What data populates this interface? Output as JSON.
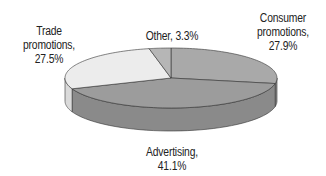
{
  "chart_data": {
    "type": "pie",
    "style": "3d",
    "title": "",
    "start_angle": "12 o'clock",
    "direction": "clockwise",
    "slices": [
      {
        "label": "Consumer promotions",
        "value": 27.9,
        "display": [
          "Consumer",
          "promotions,",
          "27.9%"
        ],
        "color": "#a9a9a9",
        "side": "#8e8e8e"
      },
      {
        "label": "Advertising",
        "value": 41.1,
        "display": [
          "Advertising,",
          "41.1%"
        ],
        "color": "#9c9c9c",
        "side": "#8a8a8a"
      },
      {
        "label": "Trade promotions",
        "value": 27.5,
        "display": [
          "Trade",
          "promotions,",
          "27.5%"
        ],
        "color": "#ececec",
        "side": "#dadada"
      },
      {
        "label": "Other",
        "value": 3.3,
        "display": [
          "Other, 3.3%"
        ],
        "color": "#b6b6b6",
        "side": "#9a9a9a"
      }
    ],
    "legend": "none (data labels)",
    "geometry": {
      "cx": 171,
      "cy": 78,
      "rx": 106,
      "ry": 30,
      "depth": 23
    }
  },
  "labels": {
    "consumer": {
      "l1": "Consumer",
      "l2": "promotions,",
      "l3": "27.9%"
    },
    "advertising": {
      "l1": "Advertising,",
      "l2": "41.1%"
    },
    "trade": {
      "l1": "Trade",
      "l2": "promotions,",
      "l3": "27.5%"
    },
    "other": {
      "l1": "Other, 3.3%"
    }
  }
}
